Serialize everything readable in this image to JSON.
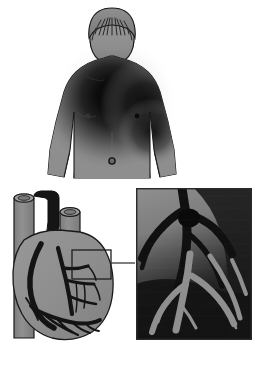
{
  "figure": {
    "title": "Angina pectoris: referred chest pain with coronary artery disease",
    "background_color": "#ffffff",
    "width": 263,
    "height": 371
  },
  "palette": {
    "skin_gray": "#8e8e8e",
    "skin_light": "#9a9a9a",
    "skin_shadow": "#6f6f6f",
    "pain_dark": "#111111",
    "outline": "#1a1a1a",
    "heart_muscle": "#8d8d8d",
    "heart_muscle_light": "#979797",
    "vessel_dark": "#151515",
    "vessel_gray": "#8a8a8a",
    "inset_background_top": "#8b8b8b",
    "inset_background_bottom": "#141414",
    "inset_border": "#2a2a2a",
    "callout_border": "#1e1e1e",
    "connector_line": "#3a3a3a",
    "white": "#ffffff"
  },
  "panels": [
    {
      "id": "torso-panel",
      "name": "upper-body-pain-distribution",
      "label": "Male torso, anterior view, with shaded pain region",
      "bounds": {
        "x": 40,
        "y": 4,
        "width": 140,
        "height": 178
      },
      "parts": [
        {
          "name": "head",
          "label": "Head with hair, viewed from front-above"
        },
        {
          "name": "neck",
          "label": "Neck"
        },
        {
          "name": "left-shoulder",
          "label": "Shoulder, viewer left"
        },
        {
          "name": "right-shoulder",
          "label": "Shoulder, viewer right"
        },
        {
          "name": "chest",
          "label": "Chest"
        },
        {
          "name": "abdomen",
          "label": "Abdomen"
        },
        {
          "name": "navel",
          "label": "Navel"
        },
        {
          "name": "left-arm",
          "label": "Arm, viewer left"
        },
        {
          "name": "right-arm",
          "label": "Arm, viewer right, within pain region"
        }
      ],
      "pain_region": {
        "name": "referred-pain-shading",
        "label": "Dark radiating shading over central chest extending to viewer-right shoulder and arm",
        "center_x": 112,
        "center_y": 96,
        "color": "#111111"
      }
    },
    {
      "id": "heart-panel",
      "name": "heart-anterior-view",
      "label": "Heart with great vessels and coronary arteries",
      "bounds": {
        "x": 6,
        "y": 190,
        "width": 118,
        "height": 160
      },
      "vessels": [
        {
          "name": "superior-vena-cava",
          "label": "Gray vessel stump, upper left",
          "color": "#8a8a8a"
        },
        {
          "name": "aorta",
          "label": "Dark arching vessel, center top",
          "color": "#151515"
        },
        {
          "name": "pulmonary-trunk",
          "label": "Gray vessel stump, upper right",
          "color": "#8a8a8a"
        },
        {
          "name": "descending-vessel",
          "label": "Vertical vessel behind heart, left side",
          "color": "#8a8a8a"
        },
        {
          "name": "left-anterior-descending-artery",
          "label": "Coronary artery branching down the front",
          "color": "#151515"
        },
        {
          "name": "right-coronary-artery",
          "label": "Coronary artery along right border",
          "color": "#151515"
        },
        {
          "name": "circumflex-branches",
          "label": "Branching coronary network over lower heart",
          "color": "#151515"
        }
      ]
    },
    {
      "id": "callout",
      "name": "magnification-callout-box",
      "label": "Rectangle marking the magnified coronary artery region",
      "bounds": {
        "x": 72,
        "y": 250,
        "width": 39,
        "height": 29
      }
    },
    {
      "id": "connector",
      "name": "callout-connector-line",
      "label": "Line joining callout box to magnified inset",
      "from_x": 111,
      "from_y": 263,
      "to_x": 136,
      "to_y": 263
    },
    {
      "id": "inset-panel",
      "name": "coronary-artery-magnified-inset",
      "label": "Magnified view of coronary artery branch with narrowed, blocked segment",
      "bounds": {
        "x": 136,
        "y": 188,
        "width": 116,
        "height": 152
      },
      "features": [
        {
          "name": "artery-main-branch",
          "label": "Main artery trunk descending through inset"
        },
        {
          "name": "artery-bifurcation",
          "label": "Y-shaped branch point, upper inset"
        },
        {
          "name": "atherosclerotic-plaque",
          "label": "Thickened dark blockage at branch junction"
        },
        {
          "name": "distal-branches",
          "label": "Finer artery branches in lower inset"
        }
      ]
    }
  ]
}
